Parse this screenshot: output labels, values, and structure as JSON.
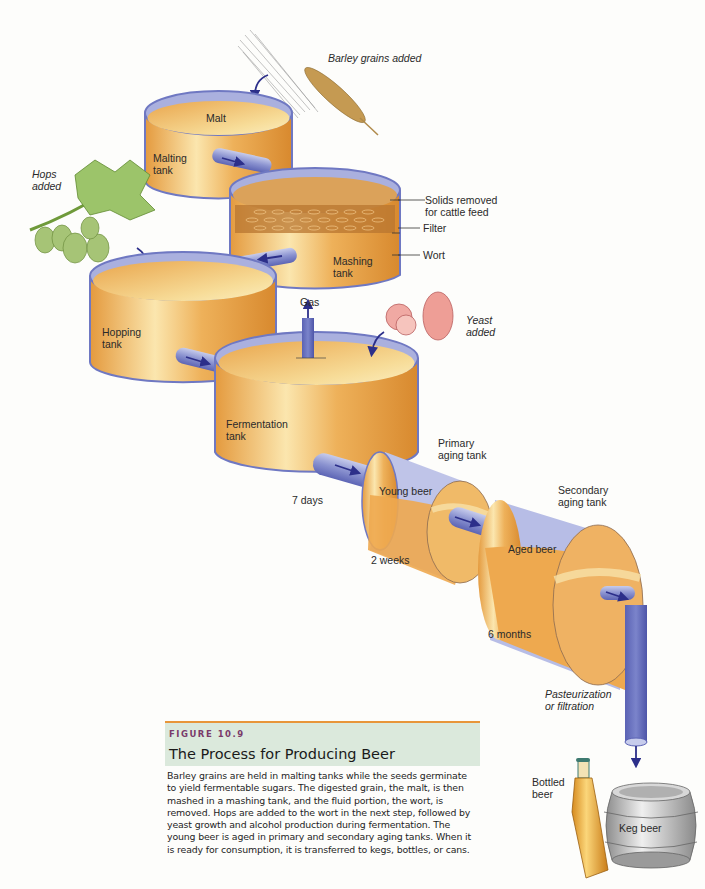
{
  "figure": {
    "number": "FIGURE 10.9",
    "title": "The Process for Producing Beer",
    "caption": "Barley grains are held in malting tanks while the seeds germinate to yield fermentable sugars. The digested grain, the malt, is then mashed in a mashing tank, and the fluid portion, the wort, is removed. Hops are added to the wort in the next step, followed by yeast growth and alcohol production during fermentation. The young beer is aged in primary and secondary aging tanks. When it is ready for consumption, it is transferred to kegs, bottles, or cans."
  },
  "colors": {
    "beer_orange": "#e8a44a",
    "beer_light": "#f8e3a8",
    "tank_rim": "#8e97cf",
    "pipe_blue": "#6f78c2",
    "arrow_navy": "#2c2f8a",
    "caption_bg": "#dbe9dc",
    "caption_rule": "#e8963a",
    "figure_label": "#7a3a6a"
  },
  "labels": {
    "barley_added": "Barley grains added",
    "malt": "Malt",
    "malting_tank": "Malting\ntank",
    "hops_added": "Hops\nadded",
    "solids_removed": "Solids removed\nfor cattle feed",
    "filter": "Filter",
    "wort": "Wort",
    "mashing_tank": "Mashing\ntank",
    "hopping_tank": "Hopping\ntank",
    "gas": "Gas",
    "yeast_added": "Yeast\nadded",
    "fermentation_tank": "Fermentation\ntank",
    "seven_days": "7 days",
    "primary_aging_tank": "Primary\naging tank",
    "young_beer": "Young beer",
    "two_weeks": "2 weeks",
    "secondary_aging_tank": "Secondary\naging tank",
    "aged_beer": "Aged beer",
    "six_months": "6 months",
    "pasteurization": "Pasteurization\nor filtration",
    "bottled_beer": "Bottled\nbeer",
    "keg_beer": "Keg beer"
  },
  "stages": [
    {
      "name": "Malting tank",
      "content": "Malt"
    },
    {
      "name": "Mashing tank",
      "content": "Wort"
    },
    {
      "name": "Hopping tank",
      "input": "Hops"
    },
    {
      "name": "Fermentation tank",
      "input": "Yeast",
      "duration": "7 days"
    },
    {
      "name": "Primary aging tank",
      "content": "Young beer",
      "duration": "2 weeks"
    },
    {
      "name": "Secondary aging tank",
      "content": "Aged beer",
      "duration": "6 months"
    },
    {
      "name": "Pasteurization or filtration"
    },
    {
      "name": "Packaging",
      "outputs": [
        "Bottled beer",
        "Keg beer"
      ]
    }
  ]
}
